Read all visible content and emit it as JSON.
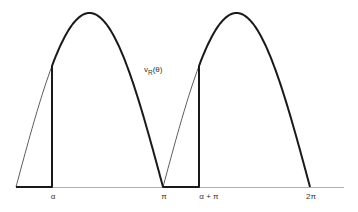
{
  "diagram": {
    "type": "rectified-waveform",
    "curve_label": {
      "main": "v",
      "subscript": "R",
      "suffix": "(θ)"
    },
    "x_labels": [
      {
        "id": "alpha",
        "text": "α",
        "x": 53
      },
      {
        "id": "pi",
        "text": "π",
        "x": 164
      },
      {
        "id": "alpha-plus-pi",
        "text": "α + π",
        "x": 209
      },
      {
        "id": "two-pi",
        "text": "2π",
        "x": 311
      }
    ],
    "colors": {
      "line": "#1a1a1a",
      "thin_line": "#333333",
      "axis": "#b0b0b0",
      "text": "#333333"
    },
    "geometry": {
      "baseline_y": 187,
      "axis_x_start": 16,
      "axis_x_end": 344,
      "amplitude_px": 174,
      "half_period_px": 147,
      "origin_x": 16,
      "alpha_x": 52
    }
  }
}
